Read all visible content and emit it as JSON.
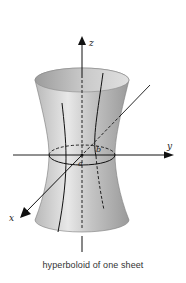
{
  "figure": {
    "title": "hyperboloid of one sheet",
    "surface": "hyperboloid of one sheet",
    "axes": {
      "x": {
        "label": "x"
      },
      "y": {
        "label": "y"
      },
      "z": {
        "label": "z"
      }
    },
    "parameters": {
      "a": {
        "label": "a"
      },
      "b": {
        "label": "b"
      }
    },
    "colors": {
      "surface_light": "#e6e6e6",
      "surface_mid": "#bdbdbd",
      "surface_dark": "#8f8f8f",
      "lines": "#111111",
      "background": "#ffffff"
    }
  },
  "caption": "hyperboloid of one sheet"
}
